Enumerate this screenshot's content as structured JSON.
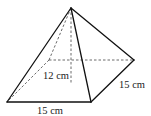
{
  "diagram": {
    "type": "square-pyramid",
    "labels": {
      "height": "12 cm",
      "base_front": "15 cm",
      "base_side": "15 cm"
    },
    "vertices": {
      "apex": [
        71,
        8
      ],
      "front_left": [
        7,
        102
      ],
      "front_right": [
        91,
        102
      ],
      "back_right": [
        134,
        60
      ],
      "back_left": [
        49,
        60
      ],
      "base_center": [
        71,
        81
      ]
    },
    "colors": {
      "line": "#111111",
      "hidden_line": "#444444",
      "text": "#222222",
      "background": "#ffffff"
    }
  }
}
